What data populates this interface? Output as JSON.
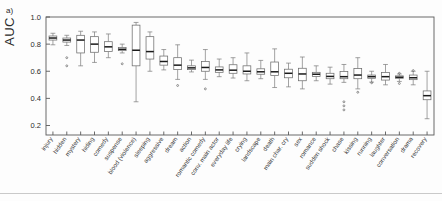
{
  "panel": {
    "label": "a)"
  },
  "axes": {
    "ylabel": "AUC",
    "yticks": [
      "0.2",
      "0.4",
      "0.6",
      "0.8",
      "1.0"
    ],
    "ytick_values": [
      0.2,
      0.4,
      0.6,
      0.8,
      1.0
    ],
    "ylim": [
      0.13,
      1.0
    ],
    "grid": false,
    "frame_color": "#5a5a5a"
  },
  "chart_data": {
    "type": "box",
    "title": "",
    "xlabel": "",
    "ylabel": "AUC",
    "ylim": [
      0.13,
      1.0
    ],
    "grid": false,
    "legend": "none",
    "categories": [
      "injury",
      "hidden",
      "mystery",
      "hiding",
      "comedy",
      "suspense",
      "blood (violence)",
      "sleeping",
      "aggressive",
      "dream",
      "action",
      "romantic comedy",
      "conv. main actor",
      "everyday life",
      "crying",
      "landscape",
      "death",
      "main char. cry",
      "sex",
      "romance",
      "sudden shock",
      "chase",
      "kissing",
      "running",
      "laughter",
      "conversation",
      "drama",
      "recovery"
    ],
    "boxes": [
      {
        "category": "injury",
        "min": 0.795,
        "q1": 0.83,
        "median": 0.845,
        "q3": 0.86,
        "max": 0.88,
        "outliers": []
      },
      {
        "category": "hidden",
        "min": 0.79,
        "q1": 0.815,
        "median": 0.83,
        "q3": 0.845,
        "max": 0.865,
        "outliers": [
          0.7,
          0.64
        ]
      },
      {
        "category": "mystery",
        "min": 0.64,
        "q1": 0.735,
        "median": 0.83,
        "q3": 0.865,
        "max": 0.895,
        "outliers": []
      },
      {
        "category": "hiding",
        "min": 0.665,
        "q1": 0.74,
        "median": 0.8,
        "q3": 0.855,
        "max": 0.89,
        "outliers": []
      },
      {
        "category": "comedy",
        "min": 0.7,
        "q1": 0.745,
        "median": 0.78,
        "q3": 0.818,
        "max": 0.875,
        "outliers": []
      },
      {
        "category": "suspense",
        "min": 0.735,
        "q1": 0.752,
        "median": 0.762,
        "q3": 0.775,
        "max": 0.8,
        "outliers": [
          0.655
        ]
      },
      {
        "category": "blood (violence)",
        "min": 0.375,
        "q1": 0.64,
        "median": 0.755,
        "q3": 0.94,
        "max": 0.96,
        "outliers": []
      },
      {
        "category": "sleeping",
        "min": 0.6,
        "q1": 0.69,
        "median": 0.745,
        "q3": 0.855,
        "max": 0.89,
        "outliers": []
      },
      {
        "category": "aggressive",
        "min": 0.61,
        "q1": 0.645,
        "median": 0.672,
        "q3": 0.712,
        "max": 0.76,
        "outliers": []
      },
      {
        "category": "dream",
        "min": 0.54,
        "q1": 0.612,
        "median": 0.645,
        "q3": 0.7,
        "max": 0.795,
        "outliers": [
          0.495
        ]
      },
      {
        "category": "action",
        "min": 0.595,
        "q1": 0.612,
        "median": 0.625,
        "q3": 0.64,
        "max": 0.682,
        "outliers": []
      },
      {
        "category": "romantic comedy",
        "min": 0.54,
        "q1": 0.6,
        "median": 0.628,
        "q3": 0.672,
        "max": 0.76,
        "outliers": [
          0.47
        ]
      },
      {
        "category": "conv. main actor",
        "min": 0.56,
        "q1": 0.592,
        "median": 0.61,
        "q3": 0.632,
        "max": 0.69,
        "outliers": []
      },
      {
        "category": "everyday life",
        "min": 0.55,
        "q1": 0.585,
        "median": 0.608,
        "q3": 0.648,
        "max": 0.7,
        "outliers": []
      },
      {
        "category": "crying",
        "min": 0.53,
        "q1": 0.58,
        "median": 0.6,
        "q3": 0.64,
        "max": 0.735,
        "outliers": []
      },
      {
        "category": "landscape",
        "min": 0.545,
        "q1": 0.578,
        "median": 0.596,
        "q3": 0.618,
        "max": 0.68,
        "outliers": []
      },
      {
        "category": "death",
        "min": 0.48,
        "q1": 0.568,
        "median": 0.596,
        "q3": 0.668,
        "max": 0.765,
        "outliers": []
      },
      {
        "category": "main char. cry",
        "min": 0.485,
        "q1": 0.552,
        "median": 0.585,
        "q3": 0.615,
        "max": 0.66,
        "outliers": []
      },
      {
        "category": "sex",
        "min": 0.47,
        "q1": 0.53,
        "median": 0.58,
        "q3": 0.622,
        "max": 0.705,
        "outliers": []
      },
      {
        "category": "romance",
        "min": 0.53,
        "q1": 0.562,
        "median": 0.578,
        "q3": 0.592,
        "max": 0.64,
        "outliers": []
      },
      {
        "category": "sudden shock",
        "min": 0.505,
        "q1": 0.545,
        "median": 0.562,
        "q3": 0.585,
        "max": 0.63,
        "outliers": []
      },
      {
        "category": "chase",
        "min": 0.518,
        "q1": 0.545,
        "median": 0.56,
        "q3": 0.598,
        "max": 0.65,
        "outliers": []
      },
      {
        "category": "kissing",
        "min": 0.47,
        "q1": 0.545,
        "median": 0.572,
        "q3": 0.62,
        "max": 0.7,
        "outliers": [
          0.445
        ]
      },
      {
        "category": "running",
        "min": 0.52,
        "q1": 0.548,
        "median": 0.56,
        "q3": 0.572,
        "max": 0.6,
        "outliers": [
          0.515
        ]
      },
      {
        "category": "laughter",
        "min": 0.5,
        "q1": 0.535,
        "median": 0.56,
        "q3": 0.59,
        "max": 0.65,
        "outliers": []
      },
      {
        "category": "conversation",
        "min": 0.525,
        "q1": 0.548,
        "median": 0.556,
        "q3": 0.566,
        "max": 0.58,
        "outliers": [
          0.585,
          0.51
        ]
      },
      {
        "category": "drama",
        "min": 0.5,
        "q1": 0.538,
        "median": 0.552,
        "q3": 0.572,
        "max": 0.6,
        "outliers": [
          0.605
        ]
      },
      {
        "category": "recovery",
        "min": 0.25,
        "q1": 0.39,
        "median": 0.42,
        "q3": 0.455,
        "max": 0.6,
        "outliers": []
      }
    ],
    "stray_outliers": [
      {
        "x_category": "chase",
        "value": 0.375
      },
      {
        "x_category": "chase",
        "value": 0.345
      },
      {
        "x_category": "chase",
        "value": 0.315
      }
    ]
  }
}
